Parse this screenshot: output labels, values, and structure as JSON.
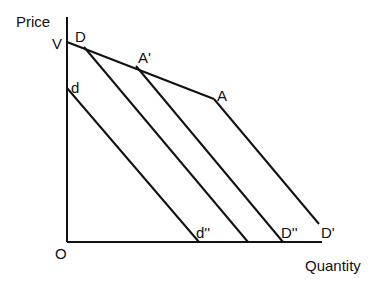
{
  "axes": {
    "y_label": "Price",
    "x_label": "Quantity",
    "origin_label": "O"
  },
  "point_labels": {
    "V": "V",
    "D": "D",
    "A_prime": "A'",
    "A": "A",
    "d": "d",
    "d_double_prime": "d''",
    "D_double_prime": "D''",
    "D_prime": "D'"
  },
  "colors": {
    "line": "#111111",
    "background": "#ffffff"
  },
  "geometry": {
    "y_axis": {
      "x": 67,
      "y_top": 17,
      "y_bottom": 242
    },
    "x_axis": {
      "y": 242,
      "x_left": 67,
      "x_right": 322
    },
    "kinked_demand_upper": [
      [
        67,
        42
      ],
      [
        214,
        99
      ]
    ],
    "demand_lines": [
      {
        "name": "D-line",
        "from": [
          84,
          47
        ],
        "to": [
          248,
          242
        ]
      },
      {
        "name": "A-prime-line",
        "from": [
          136,
          66
        ],
        "to": [
          283,
          242
        ]
      },
      {
        "name": "A-line",
        "from": [
          214,
          99
        ],
        "to": [
          319,
          224
        ]
      },
      {
        "name": "d-line",
        "from": [
          67,
          88
        ],
        "to": [
          199,
          242
        ]
      }
    ]
  }
}
